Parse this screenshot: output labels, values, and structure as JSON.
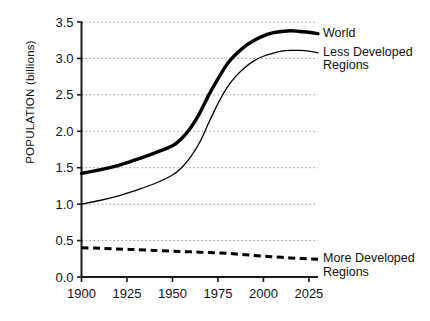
{
  "chart_data": {
    "type": "line",
    "title": "",
    "xlabel": "",
    "ylabel": "POPULATION (billions)",
    "xlim": [
      1900,
      2030
    ],
    "ylim": [
      0.0,
      3.5
    ],
    "grid": true,
    "legend_position": "right-inline",
    "x_ticks": [
      "1900",
      "1925",
      "1950",
      "1975",
      "2000",
      "2025"
    ],
    "x_tick_values": [
      1900,
      1925,
      1950,
      1975,
      2000,
      2025
    ],
    "y_ticks": [
      "0.0",
      "0.5",
      "1.0",
      "1.5",
      "2.0",
      "2.5",
      "3.0",
      "3.5"
    ],
    "y_tick_values": [
      0.0,
      0.5,
      1.0,
      1.5,
      2.0,
      2.5,
      3.0,
      3.5
    ],
    "x": [
      1900,
      1910,
      1920,
      1925,
      1930,
      1940,
      1950,
      1955,
      1960,
      1965,
      1970,
      1975,
      1980,
      1985,
      1990,
      1995,
      2000,
      2005,
      2010,
      2015,
      2020,
      2025,
      2030
    ],
    "series": [
      {
        "name": "World",
        "style": "thick-solid",
        "color": "#000000",
        "values": [
          1.42,
          1.47,
          1.53,
          1.57,
          1.61,
          1.7,
          1.8,
          1.9,
          2.05,
          2.25,
          2.5,
          2.72,
          2.92,
          3.06,
          3.17,
          3.25,
          3.31,
          3.35,
          3.37,
          3.38,
          3.37,
          3.36,
          3.34
        ]
      },
      {
        "name": "Less Developed\nRegions",
        "style": "thin-solid",
        "color": "#000000",
        "values": [
          1.0,
          1.05,
          1.11,
          1.15,
          1.19,
          1.28,
          1.4,
          1.5,
          1.65,
          1.85,
          2.12,
          2.38,
          2.6,
          2.76,
          2.88,
          2.97,
          3.03,
          3.07,
          3.1,
          3.11,
          3.11,
          3.1,
          3.08
        ]
      },
      {
        "name": "More Developed\nRegions",
        "style": "dashed",
        "color": "#000000",
        "values": [
          0.4,
          0.395,
          0.385,
          0.38,
          0.375,
          0.365,
          0.355,
          0.35,
          0.345,
          0.34,
          0.335,
          0.33,
          0.325,
          0.315,
          0.305,
          0.295,
          0.285,
          0.278,
          0.27,
          0.262,
          0.255,
          0.248,
          0.242
        ]
      }
    ],
    "annotations": [
      {
        "name": "world",
        "text": "World"
      },
      {
        "name": "less-developed",
        "text": "Less Developed\nRegions"
      },
      {
        "name": "more-developed",
        "text": "More Developed\nRegions"
      }
    ]
  },
  "axes": {
    "y_title": "POPULATION (billions)"
  }
}
